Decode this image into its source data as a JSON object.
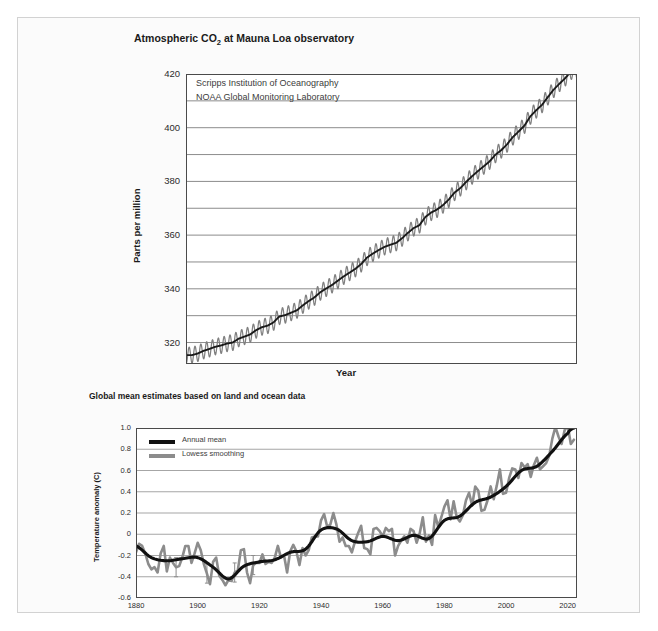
{
  "figure": {
    "background": "#fbfbfb",
    "border_color": "#d2d2d2"
  },
  "chart_data": [
    {
      "id": "co2",
      "type": "line",
      "title": "Atmospheric CO₂ at Mauna Loa observatory",
      "title_plain": "Atmospheric CO2 at Mauna Loa observatory",
      "xlabel": "Year",
      "ylabel": "Parts per million",
      "xlim": [
        1957,
        2024
      ],
      "ylim": [
        312,
        420
      ],
      "grid": true,
      "grid_axis": "y",
      "ytick_major": [
        320,
        340,
        360,
        380,
        400,
        420
      ],
      "ytick_minor": [
        330,
        350,
        370,
        390,
        410
      ],
      "xticks": [
        1960,
        1970,
        1980,
        1990,
        2000,
        2010,
        2020
      ],
      "annotations": [
        "Scripps Institution of Oceanography",
        "NOAA Global Monitoring Laboratory"
      ],
      "series": [
        {
          "name": "Monthly mean CO2",
          "color": "#808080",
          "trend_color": "#1a1a1a",
          "seasonal_amplitude": 3.0,
          "x": [
            1958,
            1959,
            1960,
            1961,
            1962,
            1963,
            1964,
            1965,
            1966,
            1967,
            1968,
            1969,
            1970,
            1971,
            1972,
            1973,
            1974,
            1975,
            1976,
            1977,
            1978,
            1979,
            1980,
            1981,
            1982,
            1983,
            1984,
            1985,
            1986,
            1987,
            1988,
            1989,
            1990,
            1991,
            1992,
            1993,
            1994,
            1995,
            1996,
            1997,
            1998,
            1999,
            2000,
            2001,
            2002,
            2003,
            2004,
            2005,
            2006,
            2007,
            2008,
            2009,
            2010,
            2011,
            2012,
            2013,
            2014,
            2015,
            2016,
            2017,
            2018,
            2019,
            2020,
            2021,
            2022,
            2023
          ],
          "values": [
            315.3,
            315.9,
            316.9,
            317.6,
            318.4,
            318.9,
            319.6,
            320.0,
            321.4,
            322.2,
            323.0,
            324.6,
            325.7,
            326.3,
            327.5,
            329.7,
            330.2,
            331.1,
            332.0,
            333.8,
            335.4,
            336.8,
            338.7,
            340.1,
            341.4,
            343.0,
            344.6,
            346.0,
            347.4,
            349.2,
            351.6,
            353.1,
            354.4,
            355.6,
            356.4,
            357.1,
            358.8,
            360.8,
            362.6,
            363.7,
            366.7,
            368.4,
            369.5,
            371.1,
            373.2,
            375.8,
            377.5,
            379.8,
            381.9,
            383.8,
            385.6,
            387.4,
            389.9,
            391.6,
            393.8,
            396.5,
            398.6,
            400.8,
            404.2,
            406.5,
            408.5,
            411.4,
            414.2,
            416.4,
            418.5,
            421.0
          ]
        }
      ]
    },
    {
      "id": "temp",
      "type": "line",
      "title": "Global mean estimates based on land and ocean data",
      "xlabel": "Year",
      "ylabel": "Temperature anomaly (C)",
      "xlim": [
        1880,
        2023
      ],
      "ylim": [
        -0.6,
        1.0
      ],
      "grid": true,
      "grid_axis": "y",
      "yticks": [
        -0.6,
        -0.4,
        -0.2,
        0,
        0.2,
        0.4,
        0.6,
        0.8,
        1.0
      ],
      "ytick_labels": [
        "-0.6",
        "-0.4",
        "-0.2",
        "0",
        "0.2",
        "0.4",
        "0.6",
        "0.8",
        "1.0"
      ],
      "xticks": [
        1880,
        1900,
        1920,
        1940,
        1960,
        1980,
        2000,
        2020
      ],
      "legend": [
        {
          "label": "Annual mean",
          "color": "#111111"
        },
        {
          "label": "Lowess smoothing",
          "color": "#8c8c8c"
        }
      ],
      "legend_position": "upper-left",
      "series": [
        {
          "name": "Annual mean",
          "color": "#8c8c8c",
          "x": [
            1880,
            1881,
            1882,
            1883,
            1884,
            1885,
            1886,
            1887,
            1888,
            1889,
            1890,
            1891,
            1892,
            1893,
            1894,
            1895,
            1896,
            1897,
            1898,
            1899,
            1900,
            1901,
            1902,
            1903,
            1904,
            1905,
            1906,
            1907,
            1908,
            1909,
            1910,
            1911,
            1912,
            1913,
            1914,
            1915,
            1916,
            1917,
            1918,
            1919,
            1920,
            1921,
            1922,
            1923,
            1924,
            1925,
            1926,
            1927,
            1928,
            1929,
            1930,
            1931,
            1932,
            1933,
            1934,
            1935,
            1936,
            1937,
            1938,
            1939,
            1940,
            1941,
            1942,
            1943,
            1944,
            1945,
            1946,
            1947,
            1948,
            1949,
            1950,
            1951,
            1952,
            1953,
            1954,
            1955,
            1956,
            1957,
            1958,
            1959,
            1960,
            1961,
            1962,
            1963,
            1964,
            1965,
            1966,
            1967,
            1968,
            1969,
            1970,
            1971,
            1972,
            1973,
            1974,
            1975,
            1976,
            1977,
            1978,
            1979,
            1980,
            1981,
            1982,
            1983,
            1984,
            1985,
            1986,
            1987,
            1988,
            1989,
            1990,
            1991,
            1992,
            1993,
            1994,
            1995,
            1996,
            1997,
            1998,
            1999,
            2000,
            2001,
            2002,
            2003,
            2004,
            2005,
            2006,
            2007,
            2008,
            2009,
            2010,
            2011,
            2012,
            2013,
            2014,
            2015,
            2016,
            2017,
            2018,
            2019,
            2020,
            2021,
            2022
          ],
          "values": [
            -0.17,
            -0.09,
            -0.11,
            -0.18,
            -0.28,
            -0.33,
            -0.31,
            -0.36,
            -0.18,
            -0.11,
            -0.35,
            -0.22,
            -0.27,
            -0.31,
            -0.3,
            -0.22,
            -0.11,
            -0.11,
            -0.27,
            -0.18,
            -0.08,
            -0.15,
            -0.28,
            -0.37,
            -0.47,
            -0.26,
            -0.22,
            -0.39,
            -0.43,
            -0.48,
            -0.43,
            -0.44,
            -0.36,
            -0.34,
            -0.15,
            -0.14,
            -0.36,
            -0.46,
            -0.29,
            -0.27,
            -0.27,
            -0.19,
            -0.28,
            -0.26,
            -0.27,
            -0.22,
            -0.11,
            -0.22,
            -0.2,
            -0.36,
            -0.16,
            -0.1,
            -0.16,
            -0.29,
            -0.13,
            -0.2,
            -0.15,
            -0.03,
            -0.02,
            -0.02,
            0.13,
            0.19,
            0.07,
            0.09,
            0.2,
            0.09,
            -0.07,
            -0.03,
            -0.11,
            -0.11,
            -0.17,
            -0.07,
            0.01,
            0.08,
            -0.13,
            -0.14,
            -0.19,
            0.05,
            0.06,
            0.03,
            -0.02,
            0.06,
            0.03,
            0.05,
            -0.2,
            -0.11,
            -0.06,
            -0.02,
            -0.08,
            0.05,
            0.03,
            -0.08,
            0.01,
            0.16,
            -0.07,
            -0.01,
            -0.1,
            0.18,
            0.07,
            0.16,
            0.26,
            0.32,
            0.14,
            0.31,
            0.16,
            0.12,
            0.18,
            0.32,
            0.39,
            0.27,
            0.45,
            0.41,
            0.22,
            0.23,
            0.32,
            0.45,
            0.33,
            0.46,
            0.61,
            0.38,
            0.39,
            0.53,
            0.62,
            0.61,
            0.53,
            0.67,
            0.63,
            0.66,
            0.54,
            0.65,
            0.72,
            0.61,
            0.64,
            0.67,
            0.74,
            0.9,
            1.01,
            0.92,
            0.85,
            0.98,
            1.02,
            0.85,
            0.89
          ]
        },
        {
          "name": "Lowess smoothing",
          "color": "#111111",
          "x": [
            1880,
            1885,
            1890,
            1895,
            1900,
            1905,
            1910,
            1915,
            1920,
            1925,
            1930,
            1935,
            1940,
            1945,
            1950,
            1955,
            1960,
            1965,
            1970,
            1975,
            1980,
            1985,
            1990,
            1995,
            2000,
            2005,
            2010,
            2015,
            2020,
            2022
          ],
          "values": [
            -0.11,
            -0.22,
            -0.25,
            -0.23,
            -0.22,
            -0.31,
            -0.42,
            -0.3,
            -0.26,
            -0.24,
            -0.17,
            -0.14,
            0.04,
            0.05,
            -0.06,
            -0.07,
            -0.02,
            -0.06,
            -0.01,
            -0.04,
            0.13,
            0.17,
            0.3,
            0.35,
            0.45,
            0.6,
            0.64,
            0.78,
            0.95,
            1.0
          ]
        }
      ]
    }
  ]
}
